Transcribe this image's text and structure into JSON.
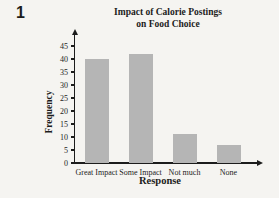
{
  "problem_number": "1",
  "chart_data": {
    "type": "bar",
    "title": "Impact of Calorie Postings on Food Choice",
    "title_line1": "Impact of Calorie Postings",
    "title_line2": "on Food Choice",
    "xlabel": "Response",
    "ylabel": "Frequency",
    "categories": [
      "Great Impact",
      "Some Impact",
      "Not much",
      "None"
    ],
    "values": [
      40,
      42,
      11,
      7
    ],
    "yticks": [
      0,
      5,
      10,
      15,
      20,
      25,
      30,
      35,
      40,
      45
    ],
    "ylim": [
      0,
      48
    ],
    "grid": false,
    "legend": "none",
    "colors": {
      "bar": "#b5b5b5",
      "axis": "#1c1c1c",
      "text": "#1c1c1c",
      "background": "#f5f4f1"
    }
  }
}
